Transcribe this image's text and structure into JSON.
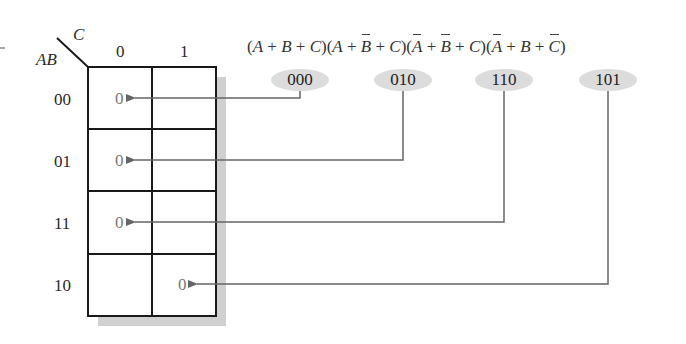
{
  "kmap": {
    "corner": {
      "row_var": "AB",
      "col_var": "C"
    },
    "col_headers": [
      "0",
      "1"
    ],
    "row_headers": [
      "00",
      "01",
      "11",
      "10"
    ],
    "cells": [
      [
        "0",
        ""
      ],
      [
        "0",
        ""
      ],
      [
        "0",
        ""
      ],
      [
        "",
        "0"
      ]
    ]
  },
  "expression": {
    "terms": [
      {
        "vars": [
          {
            "name": "A",
            "bar": false
          },
          {
            "name": "B",
            "bar": false
          },
          {
            "name": "C",
            "bar": false
          }
        ],
        "code": "000",
        "target_row": "00",
        "target_col": "0"
      },
      {
        "vars": [
          {
            "name": "A",
            "bar": false
          },
          {
            "name": "B",
            "bar": true
          },
          {
            "name": "C",
            "bar": false
          }
        ],
        "code": "010",
        "target_row": "01",
        "target_col": "0"
      },
      {
        "vars": [
          {
            "name": "A",
            "bar": true
          },
          {
            "name": "B",
            "bar": true
          },
          {
            "name": "C",
            "bar": false
          }
        ],
        "code": "110",
        "target_row": "11",
        "target_col": "0"
      },
      {
        "vars": [
          {
            "name": "A",
            "bar": true
          },
          {
            "name": "B",
            "bar": false
          },
          {
            "name": "C",
            "bar": true
          }
        ],
        "code": "101",
        "target_row": "10",
        "target_col": "1"
      }
    ],
    "plus": "+",
    "open_paren": "(",
    "close_paren": ")"
  },
  "colors": {
    "grid": "#1a1a1a",
    "shadow": "#d0d0d0",
    "code_bg": "#dcdcdc",
    "arrow": "#666666",
    "cell_value": "#777777"
  }
}
